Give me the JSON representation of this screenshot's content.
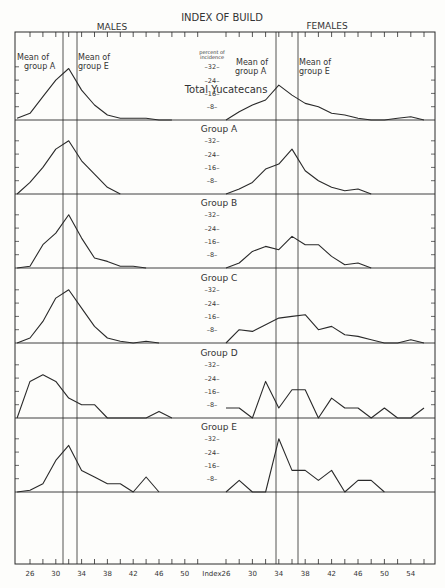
{
  "title": "INDEX OF BUILD",
  "males_label": "MALES",
  "females_label": "FEMALES",
  "y_unit_label_1": "percent of",
  "y_unit_label_2": "incidence",
  "x_axis_label": "Index",
  "annotations": {
    "males_mean_a": [
      "Mean of",
      "group A"
    ],
    "males_mean_e": [
      "Mean of",
      "group E"
    ],
    "females_mean_a": [
      "Mean of",
      "group A"
    ],
    "females_mean_e": [
      "Mean of",
      "group E"
    ]
  },
  "colors": {
    "ink": "#2a2a2a",
    "paper": "#fdfdfb"
  },
  "chart_data": {
    "type": "line",
    "title": "INDEX OF BUILD",
    "xlabel": "Index",
    "ylabel": "percent of incidence",
    "y_ticks": [
      8,
      16,
      24,
      32
    ],
    "x_ticks_males": [
      26,
      30,
      34,
      38,
      42,
      46,
      50
    ],
    "x_ticks_females": [
      26,
      30,
      34,
      38,
      42,
      46,
      50,
      54
    ],
    "mean_lines": {
      "males": {
        "group_A": 31.2,
        "group_E": 33.5
      },
      "females": {
        "group_A": 33.8,
        "group_E": 37.2
      }
    },
    "panels": [
      {
        "name": "Total Yucatecans",
        "males": {
          "x": [
            24,
            26,
            28,
            30,
            32,
            34,
            36,
            38,
            40,
            42,
            44,
            46,
            48
          ],
          "y": [
            1,
            4,
            14,
            24,
            31,
            18,
            9,
            3,
            1,
            1,
            1,
            0,
            0
          ]
        },
        "females": {
          "x": [
            26,
            28,
            30,
            32,
            34,
            36,
            38,
            40,
            42,
            44,
            46,
            48,
            50,
            52,
            54,
            56
          ],
          "y": [
            0,
            5,
            9,
            12,
            21,
            15,
            10,
            8,
            4,
            3,
            1,
            0,
            0,
            1,
            2,
            0
          ]
        }
      },
      {
        "name": "Group A",
        "males": {
          "x": [
            24,
            26,
            28,
            30,
            32,
            34,
            36,
            38,
            40
          ],
          "y": [
            0,
            7,
            16,
            27,
            32,
            20,
            12,
            4,
            0
          ]
        },
        "females": {
          "x": [
            26,
            28,
            30,
            32,
            34,
            36,
            38,
            40,
            42,
            44,
            46,
            48
          ],
          "y": [
            0,
            3,
            7,
            15,
            18,
            27,
            14,
            8,
            4,
            2,
            3,
            0
          ]
        }
      },
      {
        "name": "Group B",
        "males": {
          "x": [
            24,
            26,
            28,
            30,
            32,
            34,
            36,
            38,
            40,
            42,
            44
          ],
          "y": [
            0,
            1,
            14,
            21,
            32,
            18,
            6,
            4,
            1,
            1,
            0
          ]
        },
        "females": {
          "x": [
            26,
            28,
            30,
            32,
            34,
            36,
            38,
            40,
            42,
            44,
            46,
            48
          ],
          "y": [
            0,
            3,
            10,
            13,
            11,
            19,
            14,
            14,
            7,
            2,
            3,
            0
          ]
        }
      },
      {
        "name": "Group C",
        "males": {
          "x": [
            24,
            26,
            28,
            30,
            32,
            34,
            36,
            38,
            40,
            42,
            44,
            46
          ],
          "y": [
            0,
            3,
            13,
            27,
            32,
            21,
            10,
            3,
            1,
            0,
            1,
            0
          ]
        },
        "females": {
          "x": [
            26,
            28,
            30,
            32,
            34,
            36,
            38,
            40,
            42,
            44,
            46,
            48,
            50,
            52,
            54,
            56
          ],
          "y": [
            0,
            8,
            7,
            11,
            15,
            16,
            17,
            8,
            10,
            5,
            4,
            2,
            0,
            0,
            2,
            0
          ]
        }
      },
      {
        "name": "Group D",
        "males": {
          "x": [
            24,
            26,
            28,
            30,
            32,
            34,
            36,
            38,
            40,
            44,
            46,
            48
          ],
          "y": [
            0,
            22,
            26,
            22,
            12,
            8,
            8,
            0,
            0,
            0,
            4,
            0
          ]
        },
        "females": {
          "x": [
            26,
            28,
            30,
            32,
            34,
            36,
            38,
            40,
            42,
            44,
            46,
            48,
            50,
            52,
            54,
            56
          ],
          "y": [
            6,
            6,
            0,
            22,
            6,
            17,
            17,
            0,
            12,
            6,
            6,
            0,
            6,
            0,
            0,
            6
          ]
        }
      },
      {
        "name": "Group E",
        "males": {
          "x": [
            24,
            26,
            28,
            30,
            32,
            34,
            36,
            38,
            40,
            42,
            44,
            46
          ],
          "y": [
            0,
            1,
            5,
            19,
            28,
            13,
            9,
            5,
            5,
            0,
            9,
            0
          ]
        },
        "females": {
          "x": [
            26,
            28,
            30,
            32,
            34,
            36,
            38,
            40,
            42,
            44,
            46,
            48,
            50
          ],
          "y": [
            0,
            7,
            0,
            0,
            32,
            13,
            13,
            7,
            13,
            0,
            7,
            7,
            0
          ]
        }
      }
    ]
  }
}
